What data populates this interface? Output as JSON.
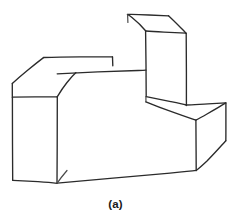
{
  "figure": {
    "caption": "(a)",
    "medium": "pencil line drawing",
    "background_color": "#ffffff",
    "ink_color": "#2b2b2b",
    "canvas": {
      "width": 231,
      "height": 221
    },
    "parts": [
      {
        "name": "upper-rear-block",
        "description": "tall rectangular block at top center-right with visible top face"
      },
      {
        "name": "left-block",
        "description": "tall rectangular block at left with visible top face and front face"
      },
      {
        "name": "connecting-arm",
        "description": "low horizontal slab joining the left block to the upper rear block"
      },
      {
        "name": "lower-right-block",
        "description": "low block at lower right with visible top face and right side face"
      }
    ],
    "strokes": {
      "upper_block_top_face": "M128,14 L168,16 L186,33 L146,31 Z",
      "upper_block_left_edge": "M146,31 L146,96",
      "upper_block_right_edge": "M186,33 L186,105",
      "upper_block_front_left_edge": "M128,14 L128,22",
      "left_block_top_face": "M43,57 L112,57 L112,66 L57,74 L12,97 Z",
      "left_block_front_face": "M12,97 L57,97 L57,183 L12,180 Z",
      "left_block_right_edge": "M57,74 L57,183",
      "arm_top_edge": "M43,57 L112,57",
      "arm_lower_edge": "M57,74 L146,70",
      "base_bottom_edge": "M57,183 L196,170",
      "lower_right_top_face": "M146,96 L186,105 L226,103 L196,118 Z",
      "lower_right_right_face": "M226,103 L226,140 L196,170 L196,118 Z",
      "lower_right_front_edge": "M196,118 L196,170"
    }
  }
}
